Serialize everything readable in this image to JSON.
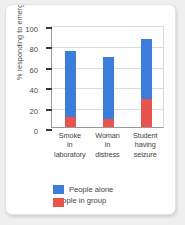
{
  "chart_data": {
    "type": "bar",
    "title": "",
    "xlabel": "",
    "ylabel": "% responding to emergency",
    "ylim": [
      0,
      100
    ],
    "yticks": [
      0,
      20,
      40,
      60,
      80,
      100
    ],
    "grid": true,
    "legend_position": "bottom-left",
    "categories": [
      "Smoke\nin\nlaboratory",
      "Woman\nin\ndistress",
      "Student\nhaving\nseizure"
    ],
    "category_lines": [
      [
        "Smoke",
        "in",
        "laboratory"
      ],
      [
        "Woman",
        "in",
        "distress"
      ],
      [
        "Student",
        "having",
        "seizure"
      ]
    ],
    "series": [
      {
        "name": "People alone",
        "color": "#3b7dd8",
        "values": [
          75,
          69,
          86
        ]
      },
      {
        "name": "People in group",
        "color": "#e8534e",
        "values": [
          10,
          8,
          27
        ]
      }
    ]
  },
  "colors": {
    "alone": "#3b7dd8",
    "group": "#e8534e",
    "card_background": "#ffffff",
    "page_background": "#efefef",
    "gridline": "#dcdcdc",
    "axis": "#9a9a9a"
  }
}
